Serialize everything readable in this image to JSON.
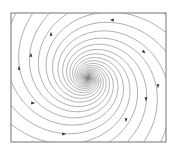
{
  "figure": {
    "type": "phase-portrait",
    "frame": {
      "x": 11,
      "y": 13,
      "width": 155,
      "height": 129,
      "stroke": "#8a8a8a"
    },
    "center": {
      "x": 88,
      "y": 78
    },
    "curve_color": "#8c8c8c",
    "arrow_color": "#333333",
    "spiral": {
      "arms": 12,
      "growth_b": 0.32,
      "min_radius": 0.6,
      "max_radius": 170,
      "aspect_y": 0.95
    },
    "arrows": [
      {
        "x": 112,
        "y": 20,
        "dir": "left"
      },
      {
        "x": 144,
        "y": 52,
        "dir": "down-right"
      },
      {
        "x": 158,
        "y": 86,
        "dir": "down"
      },
      {
        "x": 146,
        "y": 99,
        "dir": "down"
      },
      {
        "x": 126,
        "y": 120,
        "dir": "down"
      },
      {
        "x": 64,
        "y": 134,
        "dir": "right"
      },
      {
        "x": 33,
        "y": 103,
        "dir": "right"
      },
      {
        "x": 19,
        "y": 68,
        "dir": "up"
      },
      {
        "x": 31,
        "y": 55,
        "dir": "up"
      },
      {
        "x": 51,
        "y": 34,
        "dir": "up"
      }
    ]
  }
}
